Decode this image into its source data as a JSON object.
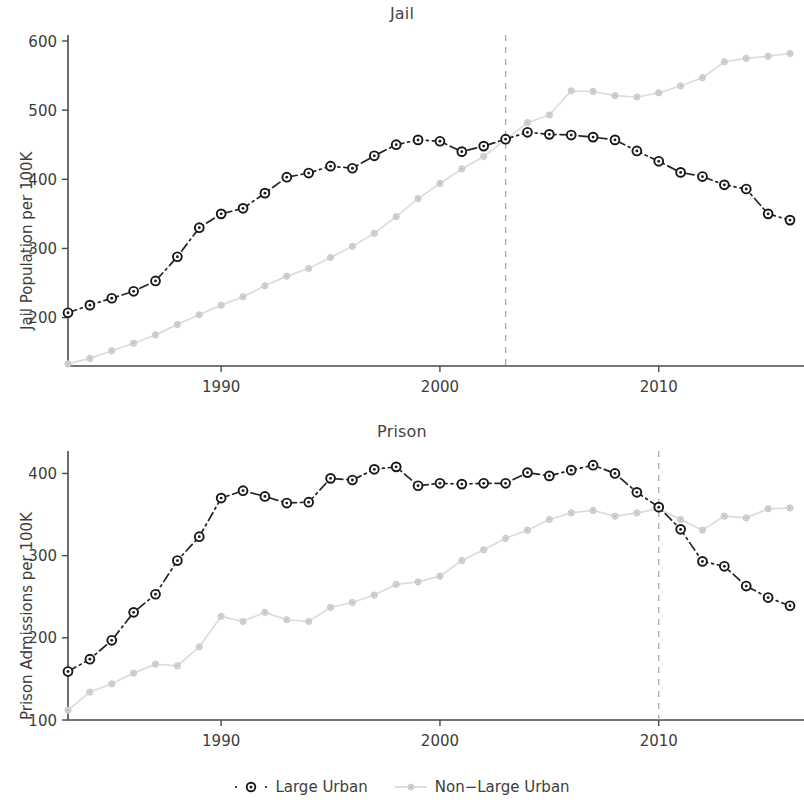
{
  "figure": {
    "legend": {
      "items": [
        {
          "label": "Large Urban",
          "key": "dashdot-circle-marker",
          "color": "#16181d"
        },
        {
          "label": "Non−Large Urban",
          "key": "solid-dot-marker",
          "color": "#d4d4d4"
        }
      ]
    }
  },
  "chart_data": [
    {
      "type": "line",
      "title": "Jail",
      "xlabel": "",
      "ylabel": "Jail Population per 100K",
      "xlim": [
        1983,
        2016
      ],
      "ylim": [
        130,
        600
      ],
      "xticks": [
        1990,
        2000,
        2010
      ],
      "xticklabels": [
        "1990",
        "2000",
        "2010"
      ],
      "yticks": [
        200,
        300,
        400,
        500,
        600
      ],
      "yticklabels": [
        "200",
        "300",
        "400",
        "500",
        "600"
      ],
      "grid": false,
      "legend_position": "bottom",
      "annotations": [
        {
          "type": "vline",
          "x": 2003,
          "style": "dashed",
          "color": "#a8a8a8"
        }
      ],
      "x": [
        1983,
        1984,
        1985,
        1986,
        1987,
        1988,
        1989,
        1990,
        1991,
        1992,
        1993,
        1994,
        1995,
        1996,
        1997,
        1998,
        1999,
        2000,
        2001,
        2002,
        2003,
        2004,
        2005,
        2006,
        2007,
        2008,
        2009,
        2010,
        2011,
        2012,
        2013,
        2014,
        2015,
        2016
      ],
      "series": [
        {
          "name": "Large Urban",
          "color": "#16181d",
          "values": [
            207,
            218,
            228,
            238,
            253,
            288,
            330,
            350,
            358,
            380,
            403,
            409,
            419,
            416,
            434,
            450,
            457,
            455,
            440,
            448,
            458,
            468,
            465,
            464,
            461,
            457,
            441,
            426,
            410,
            404,
            392,
            386,
            350,
            341
          ]
        },
        {
          "name": "Non−Large Urban",
          "color": "#d4d4d4",
          "values": [
            133,
            141,
            152,
            163,
            175,
            190,
            204,
            218,
            230,
            246,
            260,
            271,
            287,
            303,
            322,
            346,
            372,
            394,
            415,
            433,
            457,
            482,
            493,
            528,
            527,
            521,
            519,
            525,
            535,
            547,
            570,
            575,
            578,
            582
          ]
        }
      ]
    },
    {
      "type": "line",
      "title": "Prison",
      "xlabel": "",
      "ylabel": "Prison Admissions per 100K",
      "xlim": [
        1983,
        2016
      ],
      "ylim": [
        100,
        420
      ],
      "xticks": [
        1990,
        2000,
        2010
      ],
      "xticklabels": [
        "1990",
        "2000",
        "2010"
      ],
      "yticks": [
        100,
        200,
        300,
        400
      ],
      "yticklabels": [
        "100",
        "200",
        "300",
        "400"
      ],
      "grid": false,
      "legend_position": "bottom",
      "annotations": [
        {
          "type": "vline",
          "x": 2010,
          "style": "dashed",
          "color": "#a8a8a8"
        }
      ],
      "x": [
        1983,
        1984,
        1985,
        1986,
        1987,
        1988,
        1989,
        1990,
        1991,
        1992,
        1993,
        1994,
        1995,
        1996,
        1997,
        1998,
        1999,
        2000,
        2001,
        2002,
        2003,
        2004,
        2005,
        2006,
        2007,
        2008,
        2009,
        2010,
        2011,
        2012,
        2013,
        2014,
        2015,
        2016
      ],
      "series": [
        {
          "name": "Large Urban",
          "color": "#16181d",
          "values": [
            159,
            174,
            197,
            231,
            253,
            294,
            323,
            370,
            379,
            372,
            364,
            365,
            394,
            392,
            405,
            408,
            385,
            388,
            387,
            388,
            388,
            401,
            397,
            404,
            410,
            400,
            377,
            359,
            332,
            293,
            287,
            263,
            249,
            239
          ]
        },
        {
          "name": "Non−Large Urban",
          "color": "#d4d4d4",
          "values": [
            112,
            134,
            144,
            157,
            168,
            166,
            189,
            226,
            220,
            231,
            222,
            220,
            237,
            243,
            252,
            265,
            268,
            275,
            294,
            307,
            321,
            331,
            344,
            352,
            355,
            348,
            352,
            357,
            344,
            331,
            348,
            346,
            357,
            358
          ]
        }
      ]
    }
  ]
}
